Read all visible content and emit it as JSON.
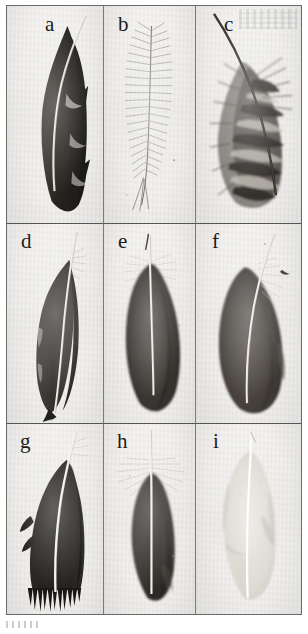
{
  "figure": {
    "type": "photographic-plate",
    "rows": 3,
    "columns": 3,
    "background_color": "#f3f2f0",
    "frame_color": "#6a6a6a",
    "divider_color": "#7a7a7a",
    "label_color": "#1b1b1b"
  },
  "panels": [
    {
      "id": "a",
      "label": "a",
      "label_x": 38,
      "label_y": 8,
      "row": 1,
      "column": 1,
      "specimen": "feather",
      "tone": "very-dark",
      "vane_color": "#2a2724",
      "shaft_color": "#eceae4",
      "notes": "long dark contour feather with pale curved shaft and notched outer vane"
    },
    {
      "id": "b",
      "label": "b",
      "label_x": 14,
      "label_y": 8,
      "row": 1,
      "column": 2,
      "specimen": "feather",
      "tone": "very-light",
      "vane_color": "#9a978f",
      "shaft_color": "#b9b6ae",
      "notes": "wispy pale plumulaceous feather with open symmetrical barbs"
    },
    {
      "id": "c",
      "label": "c",
      "label_x": 28,
      "label_y": 8,
      "row": 1,
      "column": 3,
      "specimen": "feather",
      "tone": "barred",
      "vane_color": "#55514b",
      "shaft_color": "#2c2a27",
      "notes": "curved barred feather with alternating dark and light bands"
    },
    {
      "id": "d",
      "label": "d",
      "label_x": 14,
      "label_y": 7,
      "row": 2,
      "column": 1,
      "specimen": "feather",
      "tone": "dark",
      "vane_color": "#3a3632",
      "shaft_color": "#efece6",
      "notes": "dark elongated feather with straight pale shaft and scalloped edge"
    },
    {
      "id": "e",
      "label": "e",
      "label_x": 14,
      "label_y": 7,
      "row": 2,
      "column": 2,
      "specimen": "feather",
      "tone": "dark",
      "vane_color": "#3c3833",
      "shaft_color": "#f0ede7",
      "notes": "broad rounded dark body feather with downy base filaments"
    },
    {
      "id": "f",
      "label": "f",
      "label_x": 16,
      "label_y": 7,
      "row": 2,
      "column": 3,
      "specimen": "feather",
      "tone": "dark",
      "vane_color": "#4a4640",
      "shaft_color": "#efece6",
      "notes": "broad asymmetric dark feather with fine barbs near the tip"
    },
    {
      "id": "g",
      "label": "g",
      "label_x": 13,
      "label_y": 7,
      "row": 3,
      "column": 1,
      "specimen": "feather",
      "tone": "very-dark",
      "vane_color": "#2e2b27",
      "shaft_color": "#f4f2ec",
      "notes": "very dark feather with bright white shaft and frayed fringed tip"
    },
    {
      "id": "h",
      "label": "h",
      "label_x": 13,
      "label_y": 7,
      "row": 3,
      "column": 2,
      "specimen": "feather",
      "tone": "dark",
      "vane_color": "#332f2b",
      "shaft_color": "#f2efe9",
      "notes": "dark tapering feather with a broad pale downy collar at the base"
    },
    {
      "id": "i",
      "label": "i",
      "label_x": 17,
      "label_y": 7,
      "row": 3,
      "column": 3,
      "specimen": "feather",
      "tone": "very-light",
      "vane_color": "#dedbd4",
      "shaft_color": "#ffffff",
      "notes": "pale whitish feather with a bright white shaft and faint grey vane"
    }
  ]
}
